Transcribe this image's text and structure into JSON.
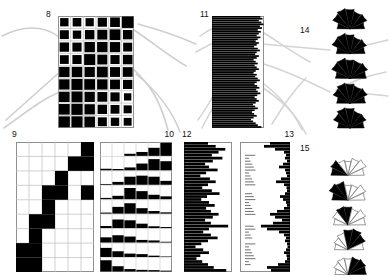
{
  "figure": {
    "title": "",
    "background": "#ffffff",
    "ink_color": "#000000",
    "grid_line_color": "#b4b4b4",
    "frame_color": "#8f8f8f",
    "leader_color": "#c9c9c9"
  },
  "panels": [
    {
      "id": "8",
      "label": "8",
      "type": "matrix-blocks"
    },
    {
      "id": "9",
      "label": "9",
      "type": "matrix-blocks"
    },
    {
      "id": "10",
      "label": "10",
      "type": "matrix-bars"
    },
    {
      "id": "11",
      "label": "11",
      "type": "bar-horizontal-left"
    },
    {
      "id": "12",
      "label": "12",
      "type": "bar-horizontal-left"
    },
    {
      "id": "13",
      "label": "13",
      "type": "bar-horizontal-right"
    },
    {
      "id": "14",
      "label": "14",
      "type": "rose-semicircle"
    },
    {
      "id": "15",
      "label": "15",
      "type": "rose-semicircle"
    }
  ],
  "chart_data": [
    {
      "id": "8",
      "type": "heatmap",
      "title": "8",
      "xlabel": "",
      "ylabel": "",
      "rows": 9,
      "cols": 6,
      "legend": "filled fraction per cell, 0-1",
      "values": [
        [
          0.52,
          0.55,
          0.5,
          0.62,
          0.7,
          1.0
        ],
        [
          0.6,
          0.52,
          0.66,
          0.74,
          0.86,
          0.66
        ],
        [
          0.66,
          0.62,
          0.8,
          0.8,
          0.78,
          0.6
        ],
        [
          0.58,
          0.62,
          0.9,
          0.74,
          0.62,
          0.68
        ],
        [
          0.8,
          0.82,
          0.78,
          0.86,
          0.74,
          0.72
        ],
        [
          0.8,
          0.92,
          0.86,
          0.8,
          0.72,
          0.64
        ],
        [
          0.82,
          0.9,
          0.78,
          0.72,
          0.62,
          0.4
        ],
        [
          0.86,
          0.94,
          0.8,
          0.66,
          0.58,
          0.48
        ],
        [
          0.9,
          0.92,
          0.82,
          0.6,
          0.52,
          0.46
        ]
      ]
    },
    {
      "id": "9",
      "type": "heatmap",
      "title": "9",
      "xlabel": "",
      "ylabel": "",
      "rows": 9,
      "cols": 6,
      "legend": "binary cell fill (1 = black)",
      "values": [
        [
          0,
          0,
          0,
          0,
          0,
          1
        ],
        [
          0,
          0,
          0,
          0,
          1,
          1
        ],
        [
          0,
          0,
          0,
          1,
          0,
          0
        ],
        [
          0,
          0,
          1,
          1,
          0,
          1
        ],
        [
          0,
          0,
          1,
          0,
          0,
          0
        ],
        [
          0,
          1,
          1,
          0,
          0,
          0
        ],
        [
          0,
          1,
          0,
          0,
          0,
          0
        ],
        [
          1,
          1,
          0,
          0,
          0,
          0
        ],
        [
          1,
          1,
          0,
          0,
          0,
          0
        ]
      ]
    },
    {
      "id": "10",
      "type": "heatmap",
      "title": "10",
      "xlabel": "",
      "ylabel": "",
      "rows": 9,
      "cols": 6,
      "legend": "bar height fraction per cell, 0-1",
      "values": [
        [
          0.0,
          0.0,
          0.16,
          0.3,
          0.62,
          1.0
        ],
        [
          0.12,
          0.1,
          0.22,
          0.52,
          0.86,
          0.7
        ],
        [
          0.06,
          0.22,
          0.62,
          0.7,
          0.62,
          0.3
        ],
        [
          0.1,
          0.26,
          0.86,
          0.62,
          0.34,
          0.22
        ],
        [
          0.08,
          0.52,
          0.8,
          0.42,
          0.2,
          0.1
        ],
        [
          0.16,
          0.66,
          0.6,
          0.34,
          0.14,
          0.08
        ],
        [
          0.4,
          0.56,
          0.46,
          0.2,
          0.16,
          0.06
        ],
        [
          0.7,
          0.44,
          0.26,
          0.22,
          0.1,
          0.04
        ],
        [
          0.86,
          0.4,
          0.18,
          0.12,
          0.1,
          0.06
        ]
      ]
    },
    {
      "id": "11",
      "type": "bar",
      "title": "11",
      "orientation": "horizontal-left",
      "xlabel": "",
      "ylabel": "",
      "xlim": [
        0,
        1
      ],
      "n": 60,
      "values": [
        0.93,
        0.97,
        0.9,
        0.95,
        0.99,
        0.92,
        0.96,
        0.88,
        0.94,
        0.9,
        0.86,
        0.93,
        0.88,
        0.84,
        0.9,
        0.86,
        0.81,
        0.88,
        0.92,
        0.86,
        0.83,
        0.9,
        0.86,
        0.8,
        0.84,
        0.88,
        0.82,
        0.86,
        0.9,
        0.84,
        0.8,
        0.86,
        0.83,
        0.88,
        0.92,
        0.86,
        0.82,
        0.87,
        0.91,
        0.85,
        0.88,
        0.93,
        0.87,
        0.82,
        0.86,
        0.9,
        0.84,
        0.79,
        0.83,
        0.88,
        0.82,
        0.77,
        0.81,
        0.86,
        0.8,
        0.75,
        0.79,
        0.84,
        0.88,
        0.95
      ]
    },
    {
      "id": "12",
      "type": "bar",
      "title": "12",
      "orientation": "horizontal-left",
      "xlabel": "",
      "ylabel": "",
      "xlim": [
        0,
        1
      ],
      "n": 44,
      "values": [
        0.5,
        0.66,
        0.86,
        0.72,
        0.58,
        0.8,
        0.6,
        0.44,
        0.52,
        0.7,
        0.46,
        0.34,
        0.54,
        0.66,
        0.5,
        0.38,
        0.58,
        0.74,
        0.48,
        0.36,
        0.52,
        0.64,
        0.46,
        0.56,
        0.72,
        0.6,
        0.44,
        0.56,
        0.92,
        0.52,
        0.4,
        0.56,
        0.7,
        0.5,
        0.36,
        0.24,
        0.4,
        0.52,
        0.34,
        0.26,
        0.38,
        0.5,
        0.62,
        0.88
      ]
    },
    {
      "id": "13",
      "type": "bar",
      "title": "13",
      "orientation": "horizontal-right",
      "xlabel": "",
      "ylabel": "",
      "xlim": [
        0,
        1
      ],
      "n": 44,
      "values": [
        0.4,
        0.52,
        0.3,
        0.12,
        0.08,
        0.1,
        0.06,
        0.14,
        0.22,
        0.1,
        0.08,
        0.06,
        0.18,
        0.28,
        0.12,
        0.07,
        0.06,
        0.1,
        0.2,
        0.14,
        0.08,
        0.06,
        0.12,
        0.26,
        0.4,
        0.3,
        0.16,
        0.34,
        0.58,
        0.46,
        0.22,
        0.12,
        0.08,
        0.1,
        0.06,
        0.05,
        0.08,
        0.12,
        0.07,
        0.06,
        0.1,
        0.24,
        0.46,
        0.38
      ],
      "tick_marks": "small horizontal whisker ticks along left side"
    },
    {
      "id": "14",
      "type": "pie",
      "title": "14",
      "subtype": "rose-semicircle",
      "legend": "five semicircular rose diagrams, all sectors filled",
      "sectors": 7,
      "roses": [
        {
          "radii": [
            0.62,
            0.92,
            1.0,
            0.95,
            0.85,
            0.9,
            0.7
          ],
          "filled": [
            1,
            1,
            1,
            1,
            1,
            1,
            1
          ]
        },
        {
          "radii": [
            0.66,
            0.96,
            1.0,
            0.92,
            0.82,
            0.88,
            0.72
          ],
          "filled": [
            1,
            1,
            1,
            1,
            1,
            1,
            1
          ]
        },
        {
          "radii": [
            0.7,
            0.98,
            1.0,
            0.9,
            0.88,
            0.94,
            0.78
          ],
          "filled": [
            1,
            1,
            1,
            1,
            1,
            1,
            1
          ]
        },
        {
          "radii": [
            0.64,
            0.9,
            1.0,
            0.94,
            0.86,
            0.92,
            0.74
          ],
          "filled": [
            1,
            1,
            1,
            1,
            1,
            1,
            1
          ]
        },
        {
          "radii": [
            0.6,
            0.88,
            1.0,
            0.96,
            0.84,
            0.86,
            0.68
          ],
          "filled": [
            1,
            1,
            1,
            1,
            1,
            1,
            1
          ]
        }
      ]
    },
    {
      "id": "15",
      "type": "pie",
      "title": "15",
      "subtype": "rose-semicircle",
      "legend": "five semicircular rose diagrams, selected sectors filled black",
      "sectors": 7,
      "roses": [
        {
          "radii": [
            0.78,
            0.88,
            0.72,
            0.66,
            0.8,
            0.92,
            0.74
          ],
          "filled": [
            1,
            1,
            0,
            0,
            0,
            0,
            0
          ]
        },
        {
          "radii": [
            0.74,
            0.96,
            0.88,
            0.7,
            0.72,
            0.9,
            0.78
          ],
          "filled": [
            1,
            1,
            1,
            0,
            0,
            0,
            0
          ]
        },
        {
          "radii": [
            0.66,
            0.78,
            0.86,
            0.84,
            0.76,
            0.9,
            0.8
          ],
          "filled": [
            0,
            0,
            1,
            1,
            0,
            0,
            0
          ]
        },
        {
          "radii": [
            0.62,
            0.7,
            0.8,
            0.92,
            0.98,
            0.88,
            0.72
          ],
          "filled": [
            0,
            0,
            0,
            1,
            1,
            1,
            0
          ]
        },
        {
          "radii": [
            0.6,
            0.72,
            0.78,
            0.74,
            0.82,
            0.9,
            0.84
          ],
          "filled": [
            0,
            0,
            0,
            0,
            1,
            1,
            1
          ]
        }
      ]
    }
  ],
  "leader_lines": {
    "description": "faint grey curved connector strokes fanning between panels",
    "color": "#cccccc"
  }
}
